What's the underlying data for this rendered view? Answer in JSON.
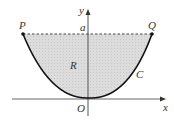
{
  "diagram": {
    "labels": {
      "y_axis": "y",
      "x_axis": "x",
      "origin": "O",
      "level": "a",
      "point_left": "P",
      "point_right": "Q",
      "region": "R",
      "curve": "C"
    },
    "colors": {
      "region_fill": "#d9d9d9",
      "curve": "#111111",
      "axes": "#555555",
      "dashed_line": "#444444"
    }
  }
}
